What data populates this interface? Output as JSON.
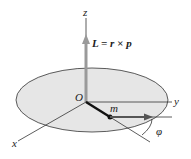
{
  "diagram": {
    "labels": {
      "z_axis": "z",
      "y_axis": "y",
      "x_axis": "x",
      "origin": "O",
      "mass": "m",
      "position_vector": "r",
      "momentum_vector": "p",
      "angle": "φ",
      "equation": "L = r × p"
    },
    "colors": {
      "disk_fill": "#e6e6e6",
      "disk_stroke": "#333333",
      "L_vector": "#9a9a9a",
      "r_vector": "#111111",
      "p_vector": "#555555",
      "axes": "#333333"
    }
  }
}
